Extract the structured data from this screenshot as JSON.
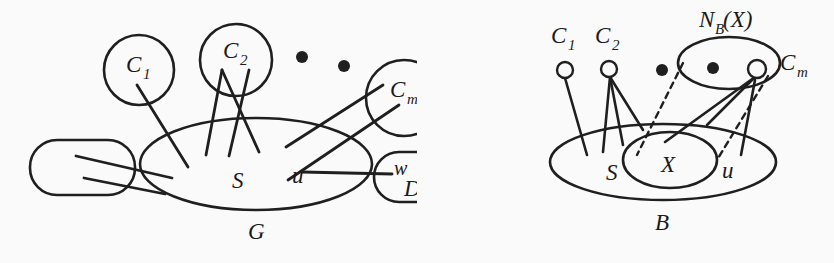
{
  "figure": {
    "caption_left": "G",
    "caption_right": "B",
    "background_color": "#fafafa",
    "ink_color": "#1f1f1f"
  },
  "left_diagram": {
    "name": "G",
    "container_label": "G",
    "set_labels": {
      "S": "S",
      "u": "u",
      "w": "w",
      "v": "v",
      "D": "D"
    },
    "cliques": [
      {
        "id": "c1",
        "label": "C",
        "sub": "1"
      },
      {
        "id": "c2",
        "label": "C",
        "sub": "2"
      },
      {
        "id": "cm",
        "label": "C",
        "sub": "m"
      }
    ],
    "ellipsis_dots": 2
  },
  "right_diagram": {
    "name": "B",
    "container_label": "B",
    "set_labels": {
      "S": "S",
      "X": "X",
      "u": "u"
    },
    "neighborhood_label": {
      "base": "N",
      "sub": "B",
      "arg": "(X)"
    },
    "cliques": [
      {
        "id": "c1",
        "label": "C",
        "sub": "1"
      },
      {
        "id": "c2",
        "label": "C",
        "sub": "2"
      },
      {
        "id": "cm",
        "label": "C",
        "sub": "m"
      }
    ],
    "ellipsis_dots": 2
  }
}
